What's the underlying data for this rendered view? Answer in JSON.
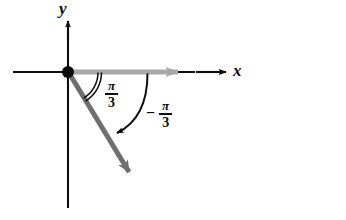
{
  "figure": {
    "kind": "coterminal-angle-diagram",
    "background_color": "#ffffff",
    "axes": {
      "x_axis_label": "x",
      "y_axis_label": "y",
      "axis_color": "#0d0d0d",
      "origin": {
        "x": 68,
        "y": 72
      },
      "x_axis_left_end": {
        "x": 13,
        "y": 72
      },
      "x_axis_right_end": {
        "x": 228,
        "y": 72
      },
      "y_axis_top_end": {
        "x": 68,
        "y": 18
      },
      "y_axis_bottom_end": {
        "x": 68,
        "y": 208
      }
    },
    "rays": {
      "initial_side": {
        "name": "initial-side-ray",
        "color": "#a8a8a8",
        "from": {
          "x": 68,
          "y": 72
        },
        "to": {
          "x": 190,
          "y": 72
        },
        "direction_degrees": 0
      },
      "terminal_side": {
        "name": "terminal-side-ray",
        "color": "#6f6f6f",
        "from": {
          "x": 68,
          "y": 72
        },
        "to": {
          "x": 136,
          "y": 183
        },
        "direction_degrees": -60
      }
    },
    "angles": [
      {
        "name": "positive-angle",
        "label_numerator": "π",
        "label_denominator": "3",
        "sign": "",
        "value_radians": 1.0472,
        "value_degrees": 60,
        "arc_style": "double-arc",
        "arc_color": "#0d0d0d",
        "arc_radius": 33,
        "label_position": {
          "x": 105,
          "y": 79
        }
      },
      {
        "name": "negative-angle",
        "label_numerator": "π",
        "label_denominator": "3",
        "sign": "−",
        "value_radians": -1.0472,
        "value_degrees": -60,
        "arc_style": "curved-arrow",
        "arc_color": "#0d0d0d",
        "arc_radius": 79,
        "label_position": {
          "x": 146,
          "y": 99
        }
      }
    ],
    "origin_dot": {
      "name": "origin-point",
      "radius": 6,
      "color": "#0d0d0d"
    }
  }
}
